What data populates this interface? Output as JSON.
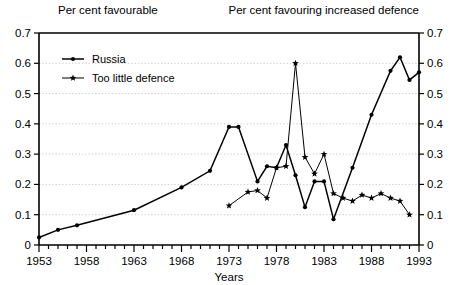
{
  "chart_data": {
    "type": "line",
    "title": "",
    "header_left": "Per cent favourable",
    "header_right": "Per cent favouring increased defence",
    "xlabel": "Years",
    "ylabel": "",
    "ylabel_right": "",
    "xlim": [
      1953,
      1993
    ],
    "ylim": [
      0,
      0.7
    ],
    "grid": true,
    "legend_position": "top-left-inside",
    "y_ticks": [
      "0",
      "0.1",
      "0.2",
      "0.3",
      "0.4",
      "0.5",
      "0.6",
      "0.7"
    ],
    "y_tick_values": [
      0,
      0.1,
      0.2,
      0.3,
      0.4,
      0.5,
      0.6,
      0.7
    ],
    "y_ticks_right": [
      "0",
      "0.1",
      "0.2",
      "0.3",
      "0.4",
      "0.5",
      "0.6",
      "0.7"
    ],
    "x_ticks": [
      "1953",
      "1958",
      "1963",
      "1968",
      "1973",
      "1978",
      "1983",
      "1988",
      "1993"
    ],
    "x_tick_values": [
      1953,
      1958,
      1963,
      1968,
      1973,
      1978,
      1983,
      1988,
      1993
    ],
    "x_minor_step": 1,
    "series": [
      {
        "name": "Russia",
        "marker": "filled-circle",
        "color": "#000000",
        "points": [
          [
            1953,
            0.025
          ],
          [
            1955,
            0.05
          ],
          [
            1957,
            0.065
          ],
          [
            1963,
            0.115
          ],
          [
            1968,
            0.19
          ],
          [
            1971,
            0.245
          ],
          [
            1973,
            0.39
          ],
          [
            1974,
            0.39
          ],
          [
            1976,
            0.21
          ],
          [
            1977,
            0.26
          ],
          [
            1978,
            0.255
          ],
          [
            1979,
            0.33
          ],
          [
            1980,
            0.23
          ],
          [
            1981,
            0.125
          ],
          [
            1982,
            0.21
          ],
          [
            1983,
            0.21
          ],
          [
            1984,
            0.085
          ],
          [
            1986,
            0.255
          ],
          [
            1988,
            0.43
          ],
          [
            1990,
            0.575
          ],
          [
            1991,
            0.62
          ],
          [
            1992,
            0.545
          ],
          [
            1993,
            0.57
          ]
        ]
      },
      {
        "name": "Too little defence",
        "marker": "star",
        "color": "#000000",
        "points": [
          [
            1973,
            0.13
          ],
          [
            1975,
            0.175
          ],
          [
            1976,
            0.18
          ],
          [
            1977,
            0.155
          ],
          [
            1978,
            0.255
          ],
          [
            1979,
            0.26
          ],
          [
            1980,
            0.6
          ],
          [
            1981,
            0.29
          ],
          [
            1982,
            0.235
          ],
          [
            1983,
            0.3
          ],
          [
            1984,
            0.17
          ],
          [
            1985,
            0.155
          ],
          [
            1986,
            0.145
          ],
          [
            1987,
            0.165
          ],
          [
            1988,
            0.155
          ],
          [
            1989,
            0.17
          ],
          [
            1990,
            0.155
          ],
          [
            1991,
            0.145
          ],
          [
            1992,
            0.1
          ]
        ]
      }
    ]
  }
}
